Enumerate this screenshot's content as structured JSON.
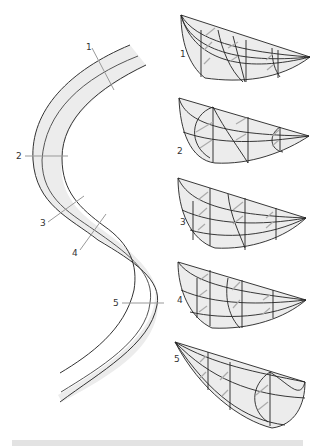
{
  "figure": {
    "type": "diagram",
    "colors": {
      "channel_fill": "#ececec",
      "bank_line": "#333333",
      "centerline": "#555555",
      "section_line": "#999999",
      "arrow": "#a0a0a0",
      "bottom_bar": "#e3e3e3"
    },
    "channel_sections": [
      {
        "label": "1"
      },
      {
        "label": "2"
      },
      {
        "label": "3"
      },
      {
        "label": "4"
      },
      {
        "label": "5"
      }
    ],
    "cross_sections": [
      {
        "label": "1"
      },
      {
        "label": "2"
      },
      {
        "label": "3"
      },
      {
        "label": "4"
      },
      {
        "label": "5"
      }
    ]
  }
}
